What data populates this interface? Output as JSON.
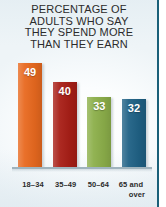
{
  "title": {
    "lines": [
      "PERCENTAGE OF",
      "ADULTS WHO SAY",
      "THEY SPEND MORE",
      "THAN THEY EARN"
    ]
  },
  "colors": {
    "bar_18_34": "#e8691f",
    "bar_35_49": "#a81e16",
    "bar_50_64": "#8caf4a",
    "bar_65_over": "#1f6185",
    "rule": "#1a6079",
    "text": "#2b2b2b",
    "value_text": "#ffffff",
    "baseline": "#9fb3bd"
  },
  "chart_data": {
    "type": "bar",
    "title": "PERCENTAGE OF ADULTS WHO SAY THEY SPEND MORE THAN THEY EARN",
    "xlabel": "",
    "ylabel": "",
    "ylim": [
      0,
      55
    ],
    "grid": false,
    "legend": "none",
    "value_suffix": "%",
    "categories": [
      "18–34",
      "35–49",
      "50–64",
      "65 and over"
    ],
    "values": [
      49,
      40,
      33,
      32
    ],
    "bars": [
      {
        "category": "18–34",
        "category_l1": "18–34",
        "category_l2": "",
        "value": 49,
        "label": "49",
        "color": "#e8691f"
      },
      {
        "category": "35–49",
        "category_l1": "35–49",
        "category_l2": "",
        "value": 40,
        "label": "40",
        "color": "#a81e16"
      },
      {
        "category": "50–64",
        "category_l1": "50–64",
        "category_l2": "",
        "value": 33,
        "label": "33",
        "color": "#8caf4a"
      },
      {
        "category": "65 and over",
        "category_l1": "65 and",
        "category_l2": "over",
        "value": 32,
        "label": "32",
        "color": "#1f6185"
      }
    ]
  }
}
